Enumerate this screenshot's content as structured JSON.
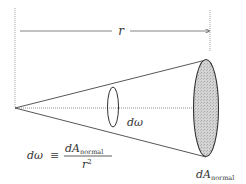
{
  "diagram": {
    "type": "solid-angle-cone",
    "labels": {
      "distance": "r",
      "solid_angle": "dω",
      "area_main": "dA",
      "area_sub": "normal"
    },
    "formula": {
      "lhs": "dω",
      "equiv": "≡",
      "numerator_main": "dA",
      "numerator_sub": "normal",
      "denominator_base": "r",
      "denominator_exp": "2"
    },
    "colors": {
      "line": "#444444",
      "guide": "#9a9a9a",
      "fill": "#cfcfcf",
      "text": "#333333"
    }
  }
}
